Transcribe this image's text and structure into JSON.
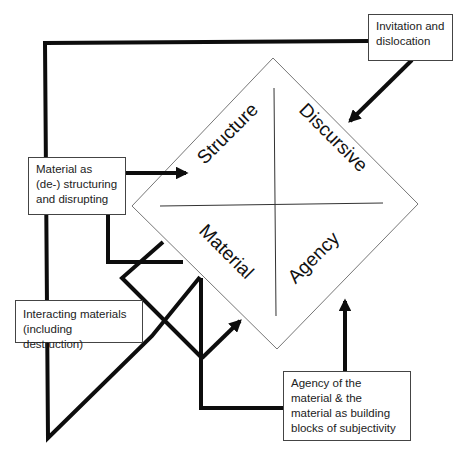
{
  "diagram": {
    "quadrants": [
      {
        "id": "structure",
        "label": "Structure"
      },
      {
        "id": "discursive",
        "label": "Discursive"
      },
      {
        "id": "material",
        "label": "Material"
      },
      {
        "id": "agency",
        "label": "Agency"
      }
    ],
    "boxes": [
      {
        "id": "invitation",
        "text": "Invitation and dislocation"
      },
      {
        "id": "destructuring",
        "text": "Material as (de-) structuring and disrupting"
      },
      {
        "id": "interacting",
        "text": "Interacting materials (including destruction)"
      },
      {
        "id": "agency-material",
        "text": "Agency of the material & the material as building blocks of subjectivity"
      }
    ],
    "colors": {
      "line": "#0d0d0d",
      "diamond_stroke": "#777777",
      "box_border": "#444444",
      "background": "#ffffff"
    }
  }
}
